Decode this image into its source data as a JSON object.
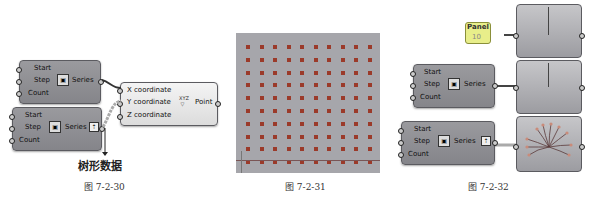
{
  "figures": [
    {
      "caption": "图 7-2-30",
      "series_components": [
        {
          "inputs": [
            "Start",
            "Step",
            "Count"
          ],
          "output": "Series"
        },
        {
          "inputs": [
            "Start",
            "Step",
            "Count"
          ],
          "output": "Series",
          "graft_icon": "tree-icon"
        }
      ],
      "point_component": {
        "inputs": [
          "X coordinate",
          "Y coordinate",
          "Z coordinate"
        ],
        "icon": "xyz-point-icon",
        "output": "Point"
      },
      "annotation": "树形数据"
    },
    {
      "caption": "图 7-2-31",
      "grid": {
        "rows": 10,
        "cols": 10,
        "point_color": "#9b3a2a",
        "background": "#a6a6ab"
      }
    },
    {
      "caption": "图 7-2-32",
      "panel": {
        "title": "Panel",
        "value": "10",
        "color": "#e8ee8a"
      },
      "series_components": [
        {
          "inputs": [
            "Start",
            "Step",
            "Count"
          ],
          "output": "Series"
        },
        {
          "inputs": [
            "Start",
            "Step",
            "Count"
          ],
          "output": "Series",
          "graft_icon": "tree-icon"
        }
      ]
    }
  ]
}
